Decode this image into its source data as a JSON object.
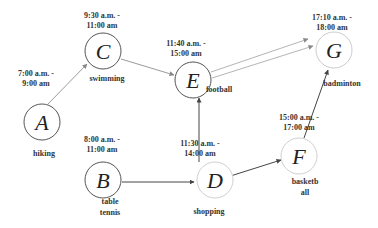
{
  "diagram": {
    "nodes": [
      {
        "id": "A",
        "letter": "A",
        "cx": 42,
        "cy": 122,
        "stroke": "#555555",
        "time1": "7:00 a.m. -",
        "time2": "9:00 am",
        "tx": 36,
        "ty1": 76,
        "activity": [
          "hiking"
        ],
        "ax": 44,
        "ay": 156
      },
      {
        "id": "C",
        "letter": "C",
        "cx": 103,
        "cy": 51,
        "stroke": "#555555",
        "time1": "9:30 a.m. -",
        "time2": "11:00 am",
        "tx": 102,
        "ty1": 18,
        "activity": [
          "swimming"
        ],
        "ax": 107,
        "ay": 81
      },
      {
        "id": "E",
        "letter": "E",
        "cx": 193,
        "cy": 80,
        "stroke": "#555555",
        "time1": "11:40 a.m. -",
        "time2": "15:00 am",
        "tx": 186,
        "ty1": 46,
        "activity": [
          "football"
        ],
        "ax": 219,
        "ay": 92
      },
      {
        "id": "G",
        "letter": "G",
        "cx": 334,
        "cy": 50,
        "stroke": "#cccccc",
        "time1": "17:10 a.m. -",
        "time2": "18:00 am",
        "tx": 332,
        "ty1": 20,
        "activity": [
          "badminton"
        ],
        "ax": 342,
        "ay": 86
      },
      {
        "id": "B",
        "letter": "B",
        "cx": 103,
        "cy": 180,
        "stroke": "#555555",
        "time1": "8:00 a.m. -",
        "time2": "11:00 am",
        "tx": 102,
        "ty1": 142,
        "activity": [
          "table",
          "tennis"
        ],
        "ax": 110,
        "ay": 204
      },
      {
        "id": "D",
        "letter": "D",
        "cx": 215,
        "cy": 180,
        "stroke": "#d0d0d0",
        "time1": "11:30 a.m. -",
        "time2": "14:00 am",
        "tx": 200,
        "ty1": 146,
        "activity": [
          "shopping"
        ],
        "ax": 209,
        "ay": 214
      },
      {
        "id": "F",
        "letter": "F",
        "cx": 299,
        "cy": 156,
        "stroke": "#d0d0d0",
        "time1": "15:00 a.m. -",
        "time2": "17:00 am",
        "tx": 299,
        "ty1": 120,
        "activity": [
          "basketb",
          "all"
        ],
        "ax": 305,
        "ay": 184
      }
    ],
    "edges": [
      {
        "from": "A",
        "to": "C",
        "color": "#9a9a9a",
        "x1": 48,
        "y1": 104,
        "x2": 87,
        "y2": 64
      },
      {
        "from": "C",
        "to": "E",
        "color": "#9a9a9a",
        "x1": 121,
        "y1": 59,
        "x2": 174,
        "y2": 75
      },
      {
        "from": "E",
        "to": "G",
        "color": "#b5b5b5",
        "x1": 211,
        "y1": 72,
        "x2": 308,
        "y2": 39
      },
      {
        "from": "E",
        "to": "G",
        "color": "#b5b5b5",
        "x1": 212,
        "y1": 78,
        "x2": 313,
        "y2": 46
      },
      {
        "from": "B",
        "to": "D",
        "color": "#444444",
        "x1": 122,
        "y1": 182,
        "x2": 194,
        "y2": 182
      },
      {
        "from": "D",
        "to": "E",
        "color": "#444444",
        "x1": 199,
        "y1": 162,
        "x2": 199,
        "y2": 98
      },
      {
        "from": "D",
        "to": "F",
        "color": "#444444",
        "x1": 221,
        "y1": 179,
        "x2": 281,
        "y2": 160
      },
      {
        "from": "F",
        "to": "G",
        "color": "#444444",
        "x1": 304,
        "y1": 138,
        "x2": 328,
        "y2": 70
      }
    ]
  }
}
